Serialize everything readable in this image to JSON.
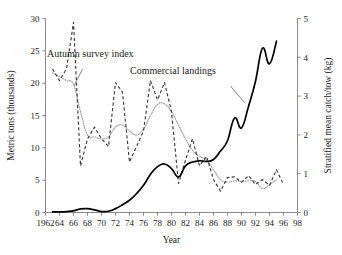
{
  "chart_data": {
    "type": "line",
    "title": "",
    "xlabel": "Year",
    "ylabel": "Metric tons (thousands)",
    "y2label": "Stratified mean catch/tow (kg)",
    "grid": false,
    "legend_position": "inline-annotations",
    "xlim": [
      1962,
      1998
    ],
    "ylim": [
      0,
      30
    ],
    "y2lim": [
      0,
      5
    ],
    "xticks": [
      1962,
      1964,
      1966,
      1968,
      1970,
      1972,
      1974,
      1976,
      1978,
      1980,
      1982,
      1984,
      1986,
      1988,
      1990,
      1992,
      1994,
      1996,
      1998
    ],
    "xtick_labels": [
      "1962",
      "64",
      "66",
      "68",
      "70",
      "72",
      "74",
      "76",
      "78",
      "80",
      "82",
      "84",
      "86",
      "88",
      "90",
      "92",
      "94",
      "96",
      "98"
    ],
    "yticks": [
      0,
      5,
      10,
      15,
      20,
      25,
      30
    ],
    "ytick_labels": [
      "0",
      "5",
      "10",
      "15",
      "20",
      "25",
      "30"
    ],
    "y2ticks": [
      0,
      1,
      2,
      3,
      4,
      5
    ],
    "y2tick_labels": [
      "0",
      "1",
      "2",
      "3",
      "4",
      "5"
    ],
    "annotations": [
      {
        "text": "Autumn survey index",
        "x": 1968.4,
        "y": 24.0
      },
      {
        "text": "Commercial landings",
        "x": 1980.2,
        "y": 21.4
      }
    ],
    "series": [
      {
        "name": "Commercial landings",
        "axis": "left",
        "style": "solid",
        "units": "metric tons (thousands)",
        "x": [
          1963,
          1964,
          1965,
          1966,
          1967,
          1968,
          1969,
          1970,
          1971,
          1972,
          1973,
          1974,
          1975,
          1976,
          1977,
          1978,
          1979,
          1980,
          1981,
          1982,
          1983,
          1984,
          1985,
          1986,
          1987,
          1988,
          1989,
          1990,
          1991,
          1992,
          1993,
          1994,
          1995
        ],
        "values": [
          0.1,
          0.1,
          0.15,
          0.25,
          0.55,
          0.6,
          0.4,
          0.15,
          0.2,
          0.6,
          1.2,
          1.9,
          2.9,
          4.2,
          5.9,
          7.1,
          7.5,
          6.8,
          5.5,
          7.2,
          7.8,
          8.0,
          7.9,
          8.2,
          9.5,
          11.1,
          14.6,
          13.1,
          16.4,
          20.3,
          25.4,
          23.0,
          26.5
        ]
      },
      {
        "name": "Autumn survey index",
        "axis": "right",
        "style": "dashed",
        "units": "kg per tow",
        "x": [
          1963,
          1964,
          1965,
          1966,
          1967,
          1968,
          1969,
          1970,
          1971,
          1972,
          1973,
          1974,
          1975,
          1976,
          1977,
          1978,
          1979,
          1980,
          1981,
          1982,
          1983,
          1984,
          1985,
          1986,
          1987,
          1988,
          1989,
          1990,
          1991,
          1992,
          1993,
          1994,
          1995,
          1996
        ],
        "values": [
          3.7,
          3.4,
          3.7,
          4.9,
          1.2,
          1.9,
          2.2,
          1.9,
          1.7,
          3.35,
          3.1,
          1.3,
          1.7,
          2.1,
          3.4,
          2.9,
          3.35,
          2.6,
          0.75,
          1.35,
          1.9,
          1.2,
          1.45,
          0.85,
          0.55,
          0.9,
          0.92,
          0.78,
          0.95,
          0.72,
          0.85,
          0.7,
          1.1,
          0.72
        ]
      },
      {
        "name": "Autumn survey index (smoothed)",
        "axis": "right",
        "style": "dotted",
        "units": "kg per tow",
        "x": [
          1963,
          1964,
          1965,
          1966,
          1967,
          1968,
          1969,
          1970,
          1971,
          1972,
          1973,
          1974,
          1975,
          1976,
          1977,
          1978,
          1979,
          1980,
          1981,
          1982,
          1983,
          1984,
          1985,
          1986,
          1987,
          1988,
          1989,
          1990,
          1991,
          1992,
          1993,
          1994,
          1995
        ],
        "values": [
          3.6,
          3.5,
          3.4,
          3.3,
          2.6,
          2.0,
          1.95,
          1.9,
          1.95,
          2.2,
          2.25,
          2.1,
          2.0,
          2.15,
          2.5,
          2.78,
          2.8,
          2.6,
          2.25,
          1.9,
          1.6,
          1.45,
          1.35,
          1.1,
          0.85,
          0.78,
          0.82,
          0.8,
          0.82,
          0.8,
          0.62,
          0.72,
          0.85
        ]
      }
    ]
  }
}
